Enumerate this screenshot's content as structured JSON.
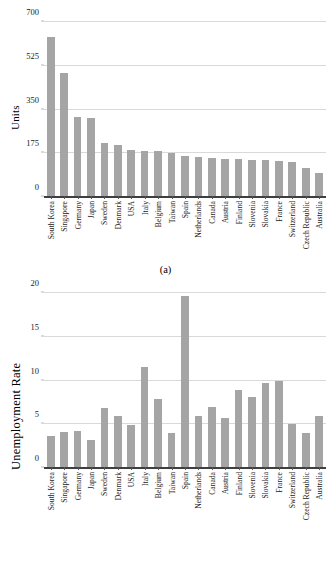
{
  "figure": {
    "panel_a_caption": "(a)",
    "panel_b_caption": "(b)"
  },
  "chart_data": [
    {
      "type": "bar",
      "panel": "(a)",
      "title": "",
      "xlabel": "",
      "ylabel": "Units",
      "ylim": [
        0,
        700
      ],
      "yticks": [
        0,
        175,
        350,
        525,
        700
      ],
      "grid": true,
      "legend": "none",
      "bar_color": "#a5a5a5",
      "categories": [
        "South Korea",
        "Singapore",
        "Germany",
        "Japan",
        "Sweden",
        "Denmark",
        "USA",
        "Italy",
        "Belgium",
        "Taiwan",
        "Spain",
        "Netherlands",
        "Canada",
        "Austria",
        "Finland",
        "Slovenia",
        "Slovakia",
        "France",
        "Switzerland",
        "Czech Republic",
        "Australia"
      ],
      "values": [
        640,
        495,
        320,
        315,
        218,
        208,
        187,
        184,
        183,
        176,
        166,
        160,
        157,
        154,
        151,
        149,
        148,
        145,
        141,
        117,
        97
      ]
    },
    {
      "type": "bar",
      "panel": "(b)",
      "title": "",
      "xlabel": "",
      "ylabel": "Unemployment Rate",
      "ylim": [
        0,
        20
      ],
      "yticks": [
        0,
        5,
        10,
        15,
        20
      ],
      "grid": true,
      "legend": "none",
      "bar_color": "#a5a5a5",
      "categories": [
        "South Korea",
        "Singapore",
        "Germany",
        "Japan",
        "Sweden",
        "Denmark",
        "USA",
        "Italy",
        "Belgium",
        "Taiwan",
        "Spain",
        "Netherlands",
        "Canada",
        "Austria",
        "Finland",
        "Slovenia",
        "Slovakia",
        "France",
        "Switzerland",
        "Czech Republic",
        "Australia"
      ],
      "values": [
        3.7,
        4.1,
        4.2,
        3.2,
        6.9,
        6.0,
        4.9,
        11.6,
        7.9,
        4.0,
        19.7,
        6.0,
        7.0,
        5.7,
        8.9,
        8.1,
        9.7,
        10.0,
        5.0,
        4.0,
        6.0
      ]
    }
  ]
}
